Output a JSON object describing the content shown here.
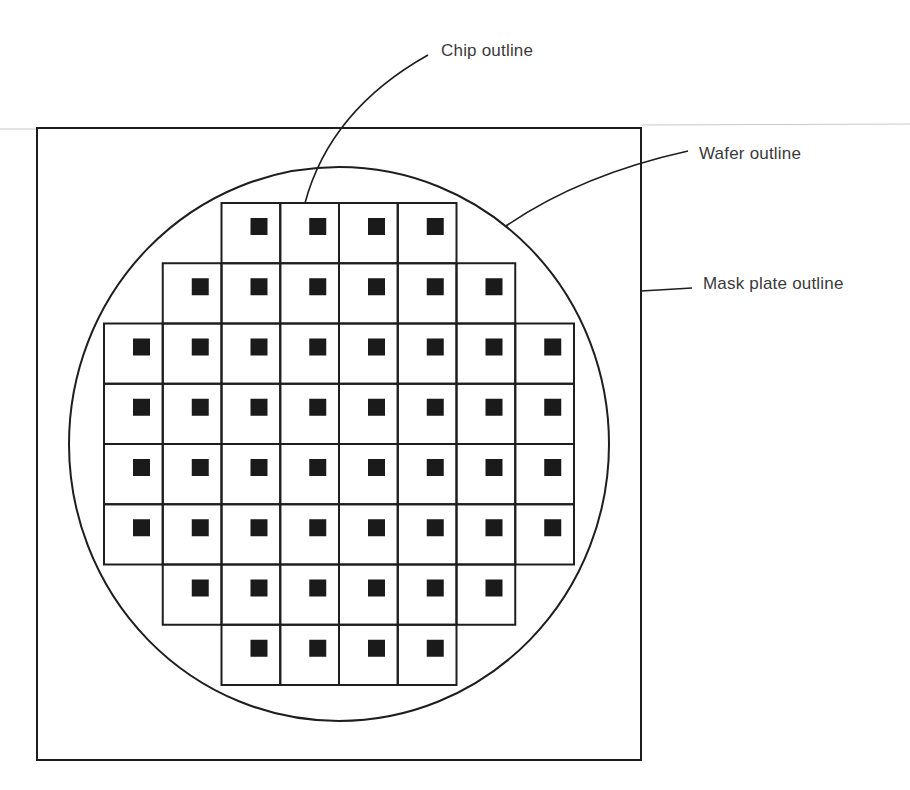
{
  "diagram": {
    "labels": {
      "chip": "Chip outline",
      "wafer": "Wafer outline",
      "mask": "Mask plate outline"
    },
    "colors": {
      "stroke": "#1e1e1e",
      "chip_fill": "#1a1a1a",
      "rule": "#c8c8c8",
      "text": "#3a3a3a"
    },
    "mask_plate": {
      "x": 37,
      "y": 128,
      "width": 604,
      "height": 632
    },
    "wafer": {
      "cx": 339,
      "cy": 444,
      "rx": 270,
      "ry": 277
    },
    "chip_grid": {
      "origin_x": 104,
      "origin_y": 203,
      "cell_w": 58.75,
      "cell_h": 60.25,
      "square_size": 17,
      "square_offset_x": 29,
      "square_offset_y": 15,
      "rows": [
        {
          "start_col": 2,
          "end_col": 5
        },
        {
          "start_col": 1,
          "end_col": 6
        },
        {
          "start_col": 0,
          "end_col": 7
        },
        {
          "start_col": 0,
          "end_col": 7
        },
        {
          "start_col": 0,
          "end_col": 7
        },
        {
          "start_col": 0,
          "end_col": 7
        },
        {
          "start_col": 1,
          "end_col": 6
        },
        {
          "start_col": 2,
          "end_col": 5
        }
      ],
      "chip_count": 48
    }
  }
}
